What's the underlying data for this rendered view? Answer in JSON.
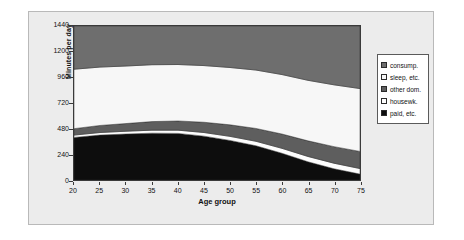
{
  "figure": {
    "background": "#ececec",
    "plot_background": "#f2f2f2",
    "frame_color": "#3a3a3a"
  },
  "axes": {
    "y_title": "Minutes per day",
    "x_title": "Age group",
    "y_ticks": [
      "0",
      "240",
      "480",
      "720",
      "960",
      "1200",
      "1440"
    ],
    "x_ticks": [
      "20",
      "25",
      "30",
      "35",
      "40",
      "45",
      "50",
      "55",
      "60",
      "65",
      "70",
      "75"
    ]
  },
  "legend": {
    "items": [
      {
        "label": "consump.",
        "color": "#6e6e6e",
        "swatch": "swatch-consump"
      },
      {
        "label": "sleep, etc.",
        "color": "#f7f7f7",
        "swatch": "swatch-sleep"
      },
      {
        "label": "other dom.",
        "color": "#5e5e5e",
        "swatch": "swatch-other-dom"
      },
      {
        "label": "housewk.",
        "color": "#fdfdfd",
        "swatch": "swatch-housewk"
      },
      {
        "label": "paid, etc.",
        "color": "#0d0d0d",
        "swatch": "swatch-paid"
      }
    ]
  },
  "chart_data": {
    "type": "area",
    "stacked": true,
    "title": "",
    "xlabel": "Age group",
    "ylabel": "Minutes per day",
    "xlim": [
      20,
      75
    ],
    "ylim": [
      0,
      1440
    ],
    "grid": false,
    "legend_position": "right",
    "x": [
      20,
      25,
      30,
      35,
      40,
      45,
      50,
      55,
      60,
      65,
      70,
      75
    ],
    "stack_order_bottom_to_top": [
      "paid, etc.",
      "housewk.",
      "other dom.",
      "sleep, etc.",
      "consump."
    ],
    "series": [
      {
        "name": "paid, etc.",
        "color": "#0d0d0d",
        "values": [
          398,
          420,
          430,
          438,
          436,
          410,
          370,
          320,
          250,
          170,
          105,
          55
        ]
      },
      {
        "name": "housewk.",
        "color": "#fdfdfd",
        "values": [
          22,
          24,
          26,
          28,
          30,
          34,
          38,
          42,
          46,
          50,
          52,
          52
        ]
      },
      {
        "name": "other dom.",
        "color": "#5e5e5e",
        "values": [
          60,
          66,
          72,
          80,
          86,
          96,
          108,
          120,
          134,
          146,
          155,
          160
        ]
      },
      {
        "name": "sleep, etc.",
        "color": "#f7f7f7",
        "values": [
          556,
          546,
          538,
          532,
          528,
          530,
          536,
          546,
          556,
          566,
          578,
          588
        ]
      },
      {
        "name": "consump.",
        "color": "#6e6e6e",
        "values": [
          404,
          384,
          374,
          362,
          360,
          370,
          388,
          412,
          454,
          508,
          550,
          585
        ]
      }
    ],
    "cumulative_tops": [
      {
        "name": "paid, etc.",
        "values": [
          398,
          420,
          430,
          438,
          436,
          410,
          370,
          320,
          250,
          170,
          105,
          55
        ]
      },
      {
        "name": "housewk.",
        "values": [
          420,
          444,
          456,
          466,
          466,
          444,
          408,
          362,
          296,
          220,
          157,
          107
        ]
      },
      {
        "name": "other dom.",
        "values": [
          480,
          510,
          528,
          546,
          552,
          540,
          516,
          482,
          430,
          366,
          312,
          267
        ]
      },
      {
        "name": "sleep, etc.",
        "values": [
          1036,
          1056,
          1066,
          1078,
          1080,
          1070,
          1052,
          1028,
          986,
          932,
          890,
          855
        ]
      },
      {
        "name": "consump.",
        "values": [
          1440,
          1440,
          1440,
          1440,
          1440,
          1440,
          1440,
          1440,
          1440,
          1440,
          1440,
          1440
        ]
      }
    ]
  }
}
